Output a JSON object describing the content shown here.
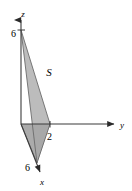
{
  "figure": {
    "background_color": "#ffffff",
    "axis_color": "#3b3b3b",
    "surface_fill": "#b3b3b3",
    "lower_face_fill": "#a6a6a6",
    "base_face_fill": "#d8d8d8"
  },
  "axes": {
    "z": {
      "label": "z",
      "arrow": "up",
      "tick_label": "6",
      "tick_value": 6
    },
    "y": {
      "label": "y",
      "arrow": "right",
      "tick_label": "2",
      "tick_value": 2
    },
    "x": {
      "label": "x",
      "arrow": "down-right",
      "tick_label": "6",
      "tick_value": 6
    }
  },
  "surface": {
    "label": "S",
    "vertices": [
      {
        "name": "z-intercept",
        "coords": "(0, 0, 6)"
      },
      {
        "name": "y-intercept",
        "coords": "(0, 2, 0)"
      },
      {
        "name": "x-intercept",
        "coords": "(6, 0, 0)"
      }
    ]
  }
}
